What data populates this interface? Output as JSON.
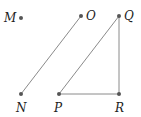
{
  "points": [
    {
      "id": "M",
      "label": "M"
    },
    {
      "id": "O",
      "label": "O"
    },
    {
      "id": "Q",
      "label": "Q"
    },
    {
      "id": "N",
      "label": "N"
    },
    {
      "id": "P",
      "label": "P"
    },
    {
      "id": "R",
      "label": "R"
    }
  ],
  "segments": [
    {
      "from": "N",
      "to": "O"
    },
    {
      "from": "P",
      "to": "Q"
    },
    {
      "from": "Q",
      "to": "R"
    },
    {
      "from": "P",
      "to": "R"
    }
  ],
  "colors": {
    "line": "#8a8a8a",
    "point": "#555555",
    "text": "#222222"
  }
}
